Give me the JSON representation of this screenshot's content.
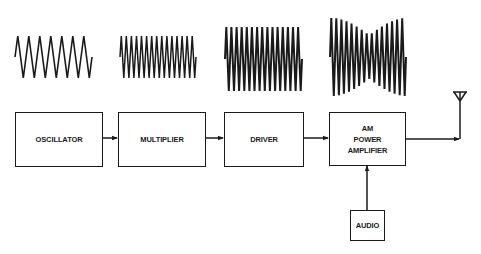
{
  "diagram": {
    "blocks": [
      {
        "id": "oscillator",
        "label": "OSCILLATOR"
      },
      {
        "id": "multiplier",
        "label": "MULTIPLIER"
      },
      {
        "id": "driver",
        "label": "DRIVER"
      },
      {
        "id": "am_power_amplifier",
        "label_lines": [
          "AM",
          "POWER",
          "AMPLIFIER"
        ]
      },
      {
        "id": "audio",
        "label": "AUDIO"
      }
    ],
    "connections": [
      {
        "from": "oscillator",
        "to": "multiplier"
      },
      {
        "from": "multiplier",
        "to": "driver"
      },
      {
        "from": "driver",
        "to": "am_power_amplifier"
      },
      {
        "from": "audio",
        "to": "am_power_amplifier"
      },
      {
        "from": "am_power_amplifier",
        "to": "antenna"
      }
    ],
    "waveforms": [
      {
        "above": "oscillator",
        "type": "low-frequency carrier",
        "cycles": 7
      },
      {
        "above": "multiplier",
        "type": "multiplied frequency carrier",
        "cycles": 15
      },
      {
        "above": "driver",
        "type": "amplified carrier",
        "cycles": 15
      },
      {
        "above": "am_power_amplifier",
        "type": "amplitude-modulated carrier",
        "cycles": 15
      }
    ],
    "antenna": {
      "icon": "antenna-icon"
    },
    "colors": {
      "line": "#1a1a1a",
      "background": "#ffffff"
    }
  }
}
